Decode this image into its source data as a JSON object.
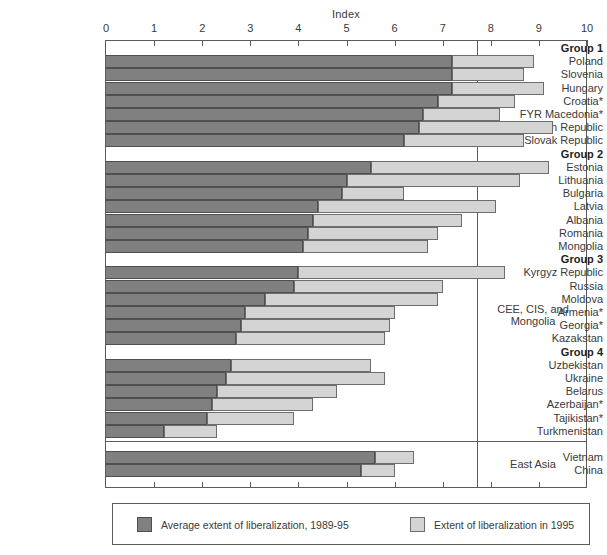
{
  "chart_data": {
    "type": "bar",
    "orientation": "horizontal",
    "stacked": true,
    "title": "",
    "xlabel": "Index",
    "ylabel": "",
    "xlim": [
      0,
      10
    ],
    "xticks": [
      "0",
      "1",
      "2",
      "3",
      "4",
      "5",
      "6",
      "7",
      "8",
      "9",
      "10"
    ],
    "grid": false,
    "legend_position": "bottom",
    "series": [
      {
        "name": "Average extent of liberalization, 1989-95",
        "color": "#808080"
      },
      {
        "name": "Extent of liberalization in 1995",
        "color": "#d4d4d4"
      }
    ],
    "categories": [
      "Poland",
      "Slovenia",
      "Hungary",
      "Croatia*",
      "FYR Macedonia*",
      "Czech Republic",
      "Slovak Republic",
      "Estonia",
      "Lithuania",
      "Bulgaria",
      "Latvia",
      "Albania",
      "Romania",
      "Mongolia",
      "Kyrgyz Republic",
      "Russia",
      "Moldova",
      "Armenia*",
      "Georgia*",
      "Kazakstan",
      "Uzbekistan",
      "Ukraine",
      "Belarus",
      "Azerbaijan*",
      "Tajikistan*",
      "Turkmenistan",
      "Vietnam",
      "China"
    ],
    "values_average": [
      7.2,
      7.2,
      7.2,
      6.9,
      6.6,
      6.5,
      6.2,
      5.5,
      5.0,
      4.9,
      4.4,
      4.3,
      4.2,
      4.1,
      4.0,
      3.9,
      3.3,
      2.9,
      2.8,
      2.7,
      2.6,
      2.5,
      2.3,
      2.2,
      2.1,
      1.2,
      5.6,
      5.3
    ],
    "values_1995": [
      8.9,
      8.7,
      9.1,
      8.5,
      8.2,
      9.3,
      8.7,
      9.2,
      8.6,
      6.2,
      8.1,
      7.4,
      6.9,
      6.7,
      8.3,
      7.0,
      6.9,
      6.0,
      5.9,
      5.8,
      5.5,
      5.8,
      4.8,
      4.3,
      3.9,
      2.3,
      6.4,
      6.0
    ],
    "group_labels": [
      "Group 1",
      "Group 2",
      "Group 3",
      "Group 4"
    ],
    "region_labels": [
      "CEE, CIS, and Mongolia",
      "East Asia"
    ]
  },
  "axis": {
    "title": "Index",
    "ticks": [
      "0",
      "1",
      "2",
      "3",
      "4",
      "5",
      "6",
      "7",
      "8",
      "9",
      "10"
    ]
  },
  "regions": [
    {
      "name": "CEE, CIS, and Mongolia",
      "line1": "CEE, CIS, and",
      "line2": "Mongolia"
    },
    {
      "name": "East Asia",
      "line1": "East Asia",
      "line2": ""
    }
  ],
  "rows": [
    {
      "label": "Group 1",
      "type": "group",
      "avg": 0,
      "ext": 0
    },
    {
      "label": "Poland",
      "type": "country",
      "avg": 7.2,
      "ext": 8.9
    },
    {
      "label": "Slovenia",
      "type": "country",
      "avg": 7.2,
      "ext": 8.7
    },
    {
      "label": "Hungary",
      "type": "country",
      "avg": 7.2,
      "ext": 9.1
    },
    {
      "label": "Croatia*",
      "type": "country",
      "avg": 6.9,
      "ext": 8.5
    },
    {
      "label": "FYR Macedonia*",
      "type": "country",
      "avg": 6.6,
      "ext": 8.2
    },
    {
      "label": "Czech Republic",
      "type": "country",
      "avg": 6.5,
      "ext": 9.3
    },
    {
      "label": "Slovak Republic",
      "type": "country",
      "avg": 6.2,
      "ext": 8.7
    },
    {
      "label": "Group 2",
      "type": "group",
      "avg": 0,
      "ext": 0
    },
    {
      "label": "Estonia",
      "type": "country",
      "avg": 5.5,
      "ext": 9.2
    },
    {
      "label": "Lithuania",
      "type": "country",
      "avg": 5.0,
      "ext": 8.6
    },
    {
      "label": "Bulgaria",
      "type": "country",
      "avg": 4.9,
      "ext": 6.2
    },
    {
      "label": "Latvia",
      "type": "country",
      "avg": 4.4,
      "ext": 8.1
    },
    {
      "label": "Albania",
      "type": "country",
      "avg": 4.3,
      "ext": 7.4
    },
    {
      "label": "Romania",
      "type": "country",
      "avg": 4.2,
      "ext": 6.9
    },
    {
      "label": "Mongolia",
      "type": "country",
      "avg": 4.1,
      "ext": 6.7
    },
    {
      "label": "Group 3",
      "type": "group",
      "avg": 0,
      "ext": 0
    },
    {
      "label": "Kyrgyz Republic",
      "type": "country",
      "avg": 4.0,
      "ext": 8.3
    },
    {
      "label": "Russia",
      "type": "country",
      "avg": 3.9,
      "ext": 7.0
    },
    {
      "label": "Moldova",
      "type": "country",
      "avg": 3.3,
      "ext": 6.9
    },
    {
      "label": "Armenia*",
      "type": "country",
      "avg": 2.9,
      "ext": 6.0
    },
    {
      "label": "Georgia*",
      "type": "country",
      "avg": 2.8,
      "ext": 5.9
    },
    {
      "label": "Kazakstan",
      "type": "country",
      "avg": 2.7,
      "ext": 5.8
    },
    {
      "label": "Group 4",
      "type": "group",
      "avg": 0,
      "ext": 0
    },
    {
      "label": "Uzbekistan",
      "type": "country",
      "avg": 2.6,
      "ext": 5.5
    },
    {
      "label": "Ukraine",
      "type": "country",
      "avg": 2.5,
      "ext": 5.8
    },
    {
      "label": "Belarus",
      "type": "country",
      "avg": 2.3,
      "ext": 4.8
    },
    {
      "label": "Azerbaijan*",
      "type": "country",
      "avg": 2.2,
      "ext": 4.3
    },
    {
      "label": "Tajikistan*",
      "type": "country",
      "avg": 2.1,
      "ext": 3.9
    },
    {
      "label": "Turkmenistan",
      "type": "country",
      "avg": 1.2,
      "ext": 2.3
    },
    {
      "label": "",
      "type": "spacer",
      "avg": 0,
      "ext": 0
    },
    {
      "label": "Vietnam",
      "type": "country",
      "avg": 5.6,
      "ext": 6.4
    },
    {
      "label": "China",
      "type": "country",
      "avg": 5.3,
      "ext": 6.0
    }
  ],
  "legend": {
    "average_label": "Average extent of liberalization, 1989-95",
    "extent_label": "Extent of liberalization in 1995"
  },
  "colors": {
    "average": "#808080",
    "extent": "#d4d4d4",
    "frame": "#5c5c5c",
    "text": "#3a3a3a",
    "background": "#ffffff"
  }
}
